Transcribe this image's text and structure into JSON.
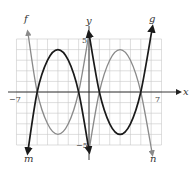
{
  "chart_data": {
    "type": "line",
    "title": "",
    "xlabel": "x",
    "ylabel": "y",
    "xlim": [
      -7,
      7
    ],
    "ylim": [
      -5,
      5
    ],
    "grid": true,
    "tick_labels": {
      "x_min": "−7",
      "x_max": "7",
      "y_max": "5",
      "y_min": "−5"
    },
    "colors": {
      "grid": "#c8c8c8",
      "axis": "#222222",
      "gray_curve": "#8a8a8a",
      "black_curve": "#1a1a1a"
    },
    "series": [
      {
        "name": "f",
        "color": "#8a8a8a",
        "x": [
          -5.9,
          -5,
          -4,
          -3,
          -2,
          -1,
          0
        ],
        "y": [
          5.6,
          0,
          -3,
          -4,
          -3,
          0,
          5.5
        ]
      },
      {
        "name": "m",
        "color": "#1a1a1a",
        "x": [
          -5.9,
          -5,
          -4,
          -3,
          -2,
          -1,
          0
        ],
        "y": [
          -5.6,
          0,
          3,
          4,
          3,
          0,
          -5.5
        ]
      },
      {
        "name": "g",
        "color": "#1a1a1a",
        "x": [
          0,
          1,
          2,
          3,
          4,
          5,
          6.1
        ],
        "y": [
          5.5,
          0,
          -3,
          -4,
          -3,
          0,
          6.0
        ]
      },
      {
        "name": "n",
        "color": "#8a8a8a",
        "x": [
          0,
          1,
          2,
          3,
          4,
          5,
          6.1
        ],
        "y": [
          -5.5,
          0,
          3,
          4,
          3,
          0,
          -5.8
        ]
      }
    ],
    "curve_labels": [
      {
        "name": "f",
        "text": "f"
      },
      {
        "name": "g",
        "text": "g"
      },
      {
        "name": "m",
        "text": "m"
      },
      {
        "name": "n",
        "text": "n"
      }
    ]
  }
}
